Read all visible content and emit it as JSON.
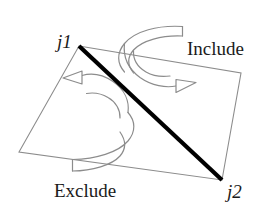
{
  "figure": {
    "type": "geometry-diagram",
    "background_color": "#ffffff",
    "outline_color": "#8c8c8c",
    "arrow_color": "#8c8c8c",
    "diagonal_color": "#000000",
    "text_color": "#1b1b1b"
  },
  "labels": {
    "joint_1": "j1",
    "joint_2": "j2",
    "region_upper": "Include",
    "region_lower": "Exclude"
  },
  "geometry": {
    "quad_points": "79,46 241,73 222,180 19,152",
    "diagonal": {
      "x1": 79,
      "y1": 46,
      "x2": 222,
      "y2": 180
    },
    "diagonal_width": 4.2,
    "outline_width": 1.1
  },
  "arrows": {
    "include": {
      "name": "include-rotation-arrow",
      "direction": "clockwise-over-top-edge",
      "body": "M 183 27 L 183 36 C 150 30 128 38 124 50 C 128 62 150 70 183 65 L 183 74",
      "outline": "M 184 26.5 L 184 36.5 C 151 30.5 130 38.5 126 50 C 130 61.5 151 69.5 184 64.5 L 184 74.5",
      "path_top": "M 182.5 26.5 C 158 25.0 135 31.0 124.5 43.5 C 116.5 53.0 117.0 63.5 124.5 72.0",
      "path_bottom": "M 182.5 36.0 C 162 35.0 142 40.5 133.5 50.0 C 127.0 57.5 127.5 65.5 133.5 73.0",
      "tail_cap": "M 182.5 26.5 L 182.5 36.0",
      "curve_outer": "M 124.5 43.5 C 123.0 56.0 128.0 68.5 140.0 77.5 C 152.0 86.0 166.0 88.0 176.0 86.0",
      "curve_inner": "M 133.5 50.5 C 133.0 59.0 137.5 67.0 146.0 72.0 C 154.0 76.5 163.0 77.0 170.0 76.0",
      "head": "M 176.0 79.5 L 176.0 92.5 L 196.0 82.5 Z"
    },
    "exclude": {
      "name": "exclude-rotation-arrow",
      "direction": "counter-clockwise-under-bottom-edge",
      "tail_cap": "M 72.5 159.5 L 72.5 171.0",
      "path_top": "M 72.5 159.5 C 96 159.0 118 152.5 128.0 141.0 C 136.0 131.5 135.5 121.0 128.0 112.5",
      "path_bottom": "M 72.5 171.0 C 92 171.0 112 165.0 120.0 156.0 C 126.5 148.5 126.0 140.5 120.0 132.0",
      "curve_outer": "M 128.0 112.5 C 129.5 101.0 124.5 89.5 113.0 81.5 C 102.0 74.0 90.5 73.0 82.0 75.5",
      "curve_inner": "M 120.0 118.0 C 120.5 110.0 116.0 102.0 108.0 97.5 C 100.5 93.0 92.5 92.5 86.5 93.5",
      "head": "M 82.0 71.0 L 82.0 84.0 L 63.0 78.0 Z"
    }
  }
}
